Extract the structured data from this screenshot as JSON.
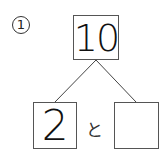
{
  "problem": {
    "number": "1",
    "top_value": "10",
    "left_value": "2",
    "connector": "と",
    "right_value": ""
  }
}
